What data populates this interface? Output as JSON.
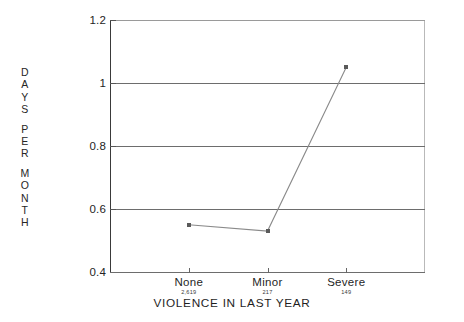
{
  "chart_data": {
    "type": "line",
    "title": "",
    "xlabel": "VIOLENCE IN LAST YEAR",
    "ylabel": "DAYS PER MONTH",
    "categories": [
      "None",
      "Minor",
      "Severe"
    ],
    "sample_sizes": [
      "2,619",
      "217",
      "149"
    ],
    "values": [
      0.55,
      0.53,
      1.05
    ],
    "ylim": [
      0.4,
      1.2
    ],
    "yticks": [
      "0.4",
      "0.6",
      "0.8",
      "1",
      "1.2"
    ],
    "ytick_values": [
      0.4,
      0.6,
      0.8,
      1.0,
      1.2
    ],
    "grid": true,
    "legend": "none",
    "series": [
      {
        "name": "Days per month",
        "values": [
          0.55,
          0.53,
          1.05
        ]
      }
    ],
    "colors": {
      "line": "#8a8a8a",
      "marker": "#5a5a5a",
      "grid": "#6d6d6d",
      "axis": "#3a3a3a",
      "text": "#1f1f1f",
      "background": "#ffffff"
    }
  },
  "ylabel_lines": [
    "DAYS",
    "PER",
    "MONTH"
  ]
}
